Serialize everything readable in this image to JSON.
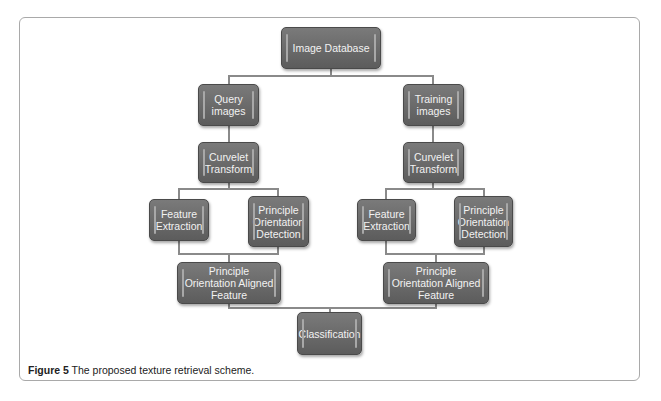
{
  "diagram": {
    "nodes": {
      "image_database": "Image Database",
      "query_images": "Query images",
      "training_images": "Training images",
      "curvelet_left": "Curvelet Transform",
      "curvelet_right": "Curvelet Transform",
      "feature_extraction_left": "Feature Extraction",
      "pod_left": "Principle Orientation Detection",
      "feature_extraction_right": "Feature Extraction",
      "pod_right": "Principle Orientation Detection",
      "poaf_left": "Principle Orientation Aligned Feature",
      "poaf_right": "Principle Orientation Aligned Feature",
      "classification": "Classification"
    },
    "edges": [
      [
        "Image Database",
        "Query images"
      ],
      [
        "Image Database",
        "Training images"
      ],
      [
        "Query images",
        "Curvelet Transform (left)"
      ],
      [
        "Training images",
        "Curvelet Transform (right)"
      ],
      [
        "Curvelet Transform (left)",
        "Feature Extraction (left)"
      ],
      [
        "Curvelet Transform (left)",
        "Principle Orientation Detection (left)"
      ],
      [
        "Curvelet Transform (right)",
        "Feature Extraction (right)"
      ],
      [
        "Curvelet Transform (right)",
        "Principle Orientation Detection (right)"
      ],
      [
        "Feature Extraction (left)",
        "Principle Orientation Aligned Feature (left)"
      ],
      [
        "Principle Orientation Detection (left)",
        "Principle Orientation Aligned Feature (left)"
      ],
      [
        "Feature Extraction (right)",
        "Principle Orientation Aligned Feature (right)"
      ],
      [
        "Principle Orientation Detection (right)",
        "Principle Orientation Aligned Feature (right)"
      ],
      [
        "Principle Orientation Aligned Feature (left)",
        "Classification"
      ],
      [
        "Principle Orientation Aligned Feature (right)",
        "Classification"
      ]
    ]
  },
  "caption": {
    "label": "Figure 5",
    "text": " The proposed texture retrieval scheme."
  }
}
